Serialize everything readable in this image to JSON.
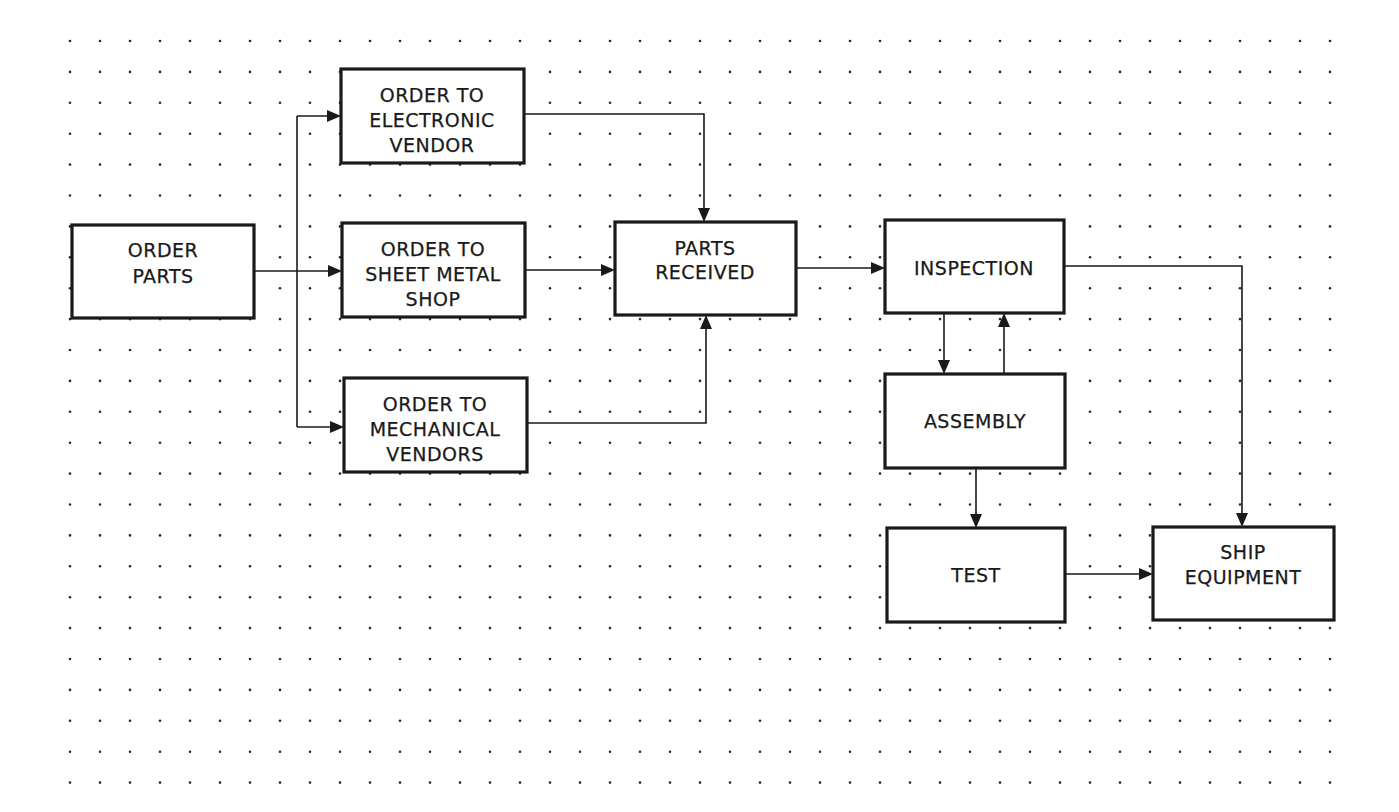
{
  "diagram": {
    "type": "flowchart",
    "background": "#ffffff",
    "line_color": "#1a1a1a",
    "grid": {
      "style": "dot",
      "x_start": 70,
      "y_start": 41,
      "dx": 30,
      "dy": 30.9,
      "cols": 43,
      "rows": 25
    },
    "nodes": {
      "order_parts": {
        "lines": [
          "ORDER",
          "PARTS"
        ]
      },
      "order_electronic": {
        "lines": [
          "ORDER TO",
          "ELECTRONIC",
          "VENDOR"
        ]
      },
      "order_sheet_metal": {
        "lines": [
          "ORDER TO",
          "SHEET METAL",
          "SHOP"
        ]
      },
      "order_mechanical": {
        "lines": [
          "ORDER TO",
          "MECHANICAL",
          "VENDORS"
        ]
      },
      "parts_received": {
        "lines": [
          "PARTS",
          "RECEIVED"
        ]
      },
      "inspection": {
        "lines": [
          "INSPECTION"
        ]
      },
      "assembly": {
        "lines": [
          "ASSEMBLY"
        ]
      },
      "test": {
        "lines": [
          "TEST"
        ]
      },
      "ship_equipment": {
        "lines": [
          "SHIP",
          "EQUIPMENT"
        ]
      }
    },
    "edges": [
      {
        "from": "ORDER PARTS",
        "to": "ORDER TO ELECTRONIC VENDOR"
      },
      {
        "from": "ORDER PARTS",
        "to": "ORDER TO SHEET METAL SHOP"
      },
      {
        "from": "ORDER PARTS",
        "to": "ORDER TO MECHANICAL VENDORS"
      },
      {
        "from": "ORDER TO ELECTRONIC VENDOR",
        "to": "PARTS RECEIVED"
      },
      {
        "from": "ORDER TO SHEET METAL SHOP",
        "to": "PARTS RECEIVED"
      },
      {
        "from": "ORDER TO MECHANICAL VENDORS",
        "to": "PARTS RECEIVED"
      },
      {
        "from": "PARTS RECEIVED",
        "to": "INSPECTION"
      },
      {
        "from": "INSPECTION",
        "to": "ASSEMBLY"
      },
      {
        "from": "ASSEMBLY",
        "to": "INSPECTION"
      },
      {
        "from": "ASSEMBLY",
        "to": "TEST"
      },
      {
        "from": "INSPECTION",
        "to": "SHIP EQUIPMENT"
      },
      {
        "from": "TEST",
        "to": "SHIP EQUIPMENT"
      }
    ]
  }
}
